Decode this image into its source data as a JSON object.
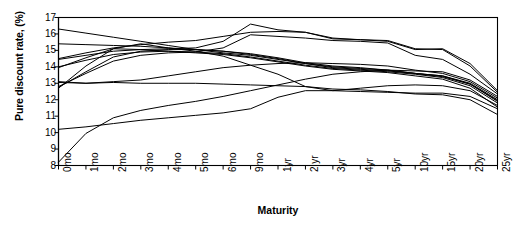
{
  "chart_data": {
    "type": "line",
    "title": "",
    "xlabel": "Maturity",
    "ylabel": "Pure discount rate, (%)",
    "categories": [
      "0mo",
      "1mo",
      "2mo",
      "3mo",
      "4mo",
      "5mo",
      "6mo",
      "9mo",
      "1yr",
      "2 yr",
      "3yr",
      "4yr",
      "5yr",
      "10yr",
      "15yr",
      "20yr",
      "25yr"
    ],
    "ylim": [
      8,
      17
    ],
    "yticks": [
      8,
      9,
      10,
      11,
      12,
      13,
      14,
      15,
      16,
      17
    ],
    "ytick_labels": [
      "8",
      "9",
      "10",
      "11",
      "12",
      "13",
      "14",
      "15",
      "16",
      "17"
    ],
    "grid": false,
    "legend": "none",
    "series": [
      {
        "name": "curve-1",
        "values": [
          16.3,
          16.05,
          15.8,
          15.55,
          15.3,
          15.05,
          14.85,
          14.7,
          14.45,
          14.2,
          13.95,
          13.85,
          13.75,
          13.6,
          13.45,
          13.0,
          12.0
        ]
      },
      {
        "name": "curve-2",
        "values": [
          15.4,
          15.35,
          15.3,
          15.25,
          15.15,
          15.05,
          14.95,
          14.8,
          14.55,
          14.25,
          14.05,
          13.95,
          13.8,
          13.6,
          13.4,
          12.95,
          11.9
        ]
      },
      {
        "name": "curve-3",
        "values": [
          14.5,
          14.85,
          15.15,
          15.35,
          15.5,
          15.6,
          15.85,
          16.1,
          16.15,
          16.1,
          15.7,
          15.65,
          15.55,
          15.05,
          15.1,
          14.2,
          12.55
        ]
      },
      {
        "name": "curve-4",
        "values": [
          14.45,
          14.7,
          14.95,
          15.05,
          15.1,
          15.15,
          15.55,
          16.6,
          16.25,
          16.1,
          15.75,
          15.65,
          15.6,
          15.1,
          15.05,
          14.05,
          12.45
        ]
      },
      {
        "name": "curve-5",
        "values": [
          14.0,
          14.4,
          14.75,
          14.9,
          14.95,
          14.9,
          14.8,
          14.6,
          14.35,
          14.1,
          13.9,
          13.8,
          13.7,
          13.55,
          13.35,
          12.85,
          11.8
        ]
      },
      {
        "name": "curve-6",
        "values": [
          13.95,
          14.55,
          15.1,
          15.05,
          14.95,
          14.85,
          14.75,
          14.55,
          14.3,
          14.05,
          13.85,
          13.75,
          13.65,
          13.45,
          13.25,
          12.7,
          11.55
        ]
      },
      {
        "name": "curve-7",
        "values": [
          13.1,
          13.0,
          13.05,
          13.0,
          13.0,
          13.0,
          12.95,
          12.9,
          12.85,
          12.8,
          12.65,
          12.6,
          12.5,
          12.35,
          12.3,
          12.0,
          11.1
        ]
      },
      {
        "name": "curve-8",
        "values": [
          13.05,
          13.0,
          13.1,
          13.2,
          13.45,
          13.7,
          13.95,
          14.1,
          14.2,
          14.25,
          14.2,
          14.15,
          14.05,
          13.8,
          13.6,
          13.1,
          12.1
        ]
      },
      {
        "name": "curve-9",
        "values": [
          12.8,
          13.6,
          14.35,
          14.7,
          14.85,
          14.9,
          15.15,
          15.95,
          15.85,
          15.75,
          15.6,
          15.55,
          15.45,
          14.7,
          14.45,
          13.55,
          12.35
        ]
      },
      {
        "name": "curve-10",
        "values": [
          12.75,
          13.7,
          14.6,
          14.95,
          15.05,
          15.05,
          14.95,
          14.75,
          14.5,
          14.2,
          14.0,
          13.9,
          13.8,
          13.6,
          13.45,
          12.95,
          11.95
        ]
      },
      {
        "name": "curve-11",
        "values": [
          12.7,
          14.05,
          15.1,
          15.4,
          15.15,
          14.95,
          14.65,
          14.1,
          13.55,
          12.8,
          12.55,
          12.5,
          12.45,
          12.4,
          12.4,
          12.2,
          11.45
        ]
      },
      {
        "name": "curve-12",
        "values": [
          10.2,
          10.35,
          10.55,
          10.75,
          10.9,
          11.05,
          11.2,
          11.45,
          12.15,
          12.55,
          12.55,
          12.7,
          12.85,
          12.9,
          12.85,
          12.55,
          11.65
        ]
      },
      {
        "name": "curve-13",
        "values": [
          8.2,
          9.95,
          10.9,
          11.35,
          11.65,
          11.9,
          12.2,
          12.55,
          12.9,
          13.25,
          13.55,
          13.7,
          13.8,
          13.75,
          13.7,
          13.2,
          12.2
        ]
      }
    ]
  },
  "axes": {
    "y_title": "Pure discount rate, (%)",
    "x_title": "Maturity"
  }
}
